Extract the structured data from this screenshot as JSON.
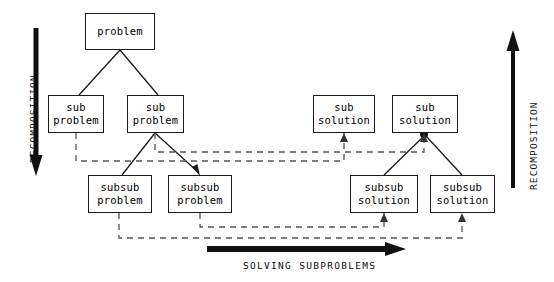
{
  "diagram": {
    "background_color": "#ffffff",
    "stroke_color": "#1a1a1a",
    "axes": {
      "left": {
        "label": "DECOMPOSITION",
        "direction": "down",
        "icon": "down-arrow-icon"
      },
      "right": {
        "label": "RECOMPOSITION",
        "direction": "up",
        "icon": "up-arrow-icon"
      },
      "bottom": {
        "label": "SOLVING SUBPROBLEMS",
        "direction": "right",
        "icon": "right-arrow-icon"
      }
    },
    "nodes": [
      {
        "id": "problem",
        "line1": "problem",
        "line2": "",
        "x": 85,
        "y": 13,
        "w": 70,
        "h": 37
      },
      {
        "id": "sub-problem-1",
        "line1": "sub",
        "line2": "problem",
        "x": 48,
        "y": 95,
        "w": 56,
        "h": 38
      },
      {
        "id": "sub-problem-2",
        "line1": "sub",
        "line2": "problem",
        "x": 127,
        "y": 95,
        "w": 57,
        "h": 38
      },
      {
        "id": "subsub-problem-1",
        "line1": "subsub",
        "line2": "problem",
        "x": 88,
        "y": 175,
        "w": 64,
        "h": 38
      },
      {
        "id": "subsub-problem-2",
        "line1": "subsub",
        "line2": "problem",
        "x": 168,
        "y": 175,
        "w": 64,
        "h": 38
      },
      {
        "id": "sub-solution-1",
        "line1": "sub",
        "line2": "solution",
        "x": 313,
        "y": 95,
        "w": 62,
        "h": 38
      },
      {
        "id": "sub-solution-2",
        "line1": "sub",
        "line2": "solution",
        "x": 392,
        "y": 95,
        "w": 66,
        "h": 38
      },
      {
        "id": "subsub-solution-1",
        "line1": "subsub",
        "line2": "solution",
        "x": 350,
        "y": 175,
        "w": 68,
        "h": 38
      },
      {
        "id": "subsub-solution-2",
        "line1": "subsub",
        "line2": "solution",
        "x": 430,
        "y": 175,
        "w": 65,
        "h": 38
      }
    ],
    "solid_edges": [
      {
        "from": "problem",
        "to": "sub-problem-1"
      },
      {
        "from": "problem",
        "to": "sub-problem-2"
      },
      {
        "from": "sub-problem-2",
        "to": "subsub-problem-1"
      },
      {
        "from": "sub-problem-2",
        "to": "subsub-problem-2"
      },
      {
        "from": "subsub-solution-1",
        "to": "sub-solution-2"
      },
      {
        "from": "subsub-solution-2",
        "to": "sub-solution-2"
      }
    ],
    "dashed_edges": [
      {
        "from": "sub-problem-1",
        "to": "sub-solution-1",
        "note": "lower dashed routing"
      },
      {
        "from": "sub-problem-2",
        "to": "sub-solution-2",
        "note": "upper dashed routing"
      },
      {
        "from": "subsub-problem-1",
        "to": "subsub-solution-2",
        "note": "lower dashed routing"
      },
      {
        "from": "subsub-problem-2",
        "to": "subsub-solution-1",
        "note": "upper dashed routing"
      }
    ]
  }
}
